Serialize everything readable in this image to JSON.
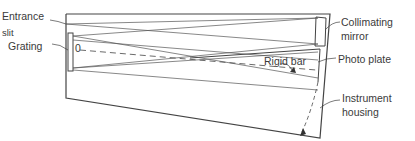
{
  "labels": {
    "entrance_slit_line1": "Entrance",
    "entrance_slit_line2": "slit",
    "grating": "Grating",
    "pivot": "0",
    "collimating_mirror_line1": "Collimating",
    "collimating_mirror_line2": "mirror",
    "rigid_bar": "Rigid bar",
    "photo_plate": "Photo plate",
    "instrument_housing_line1": "Instrument",
    "instrument_housing_line2": "housing"
  },
  "colors": {
    "line": "#444444",
    "text": "#3a3a3a",
    "background": "#ffffff"
  }
}
